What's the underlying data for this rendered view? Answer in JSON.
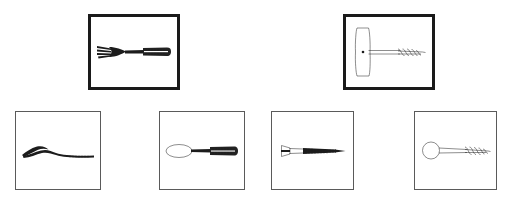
{
  "panel": {
    "title": "Visual analogy item",
    "background_color": "#ffffff",
    "prompt_border_color": "#1a1a1a",
    "option_border_color": "#5a5a5a",
    "ink_color": "#1c1c1c"
  },
  "prompt_row": {
    "row_label": "Top row",
    "boxes": [
      {
        "position": 1,
        "item_name": "fork",
        "icon": "fork-icon",
        "description": "Four-tined table fork with textured handle, pointing left",
        "border_style": "thick",
        "x": 88,
        "y": 14,
        "width": 92,
        "height": 76
      },
      {
        "position": 2,
        "item_name": "t-handle-screw",
        "icon": "t-handle-screw-icon",
        "description": "T-handled corkscrew style screw with vertical wooden handle and threaded shaft pointing right",
        "border_style": "thick",
        "x": 343,
        "y": 14,
        "width": 92,
        "height": 76
      }
    ]
  },
  "option_row": {
    "row_label": "Bottom row",
    "boxes": [
      {
        "position": 1,
        "item_name": "curved-tool",
        "icon": "curved-blade-icon",
        "description": "Long curved blade or shoehorn shaped tool with hooked tip at left",
        "border_style": "thin",
        "x": 15,
        "y": 111,
        "width": 86,
        "height": 79
      },
      {
        "position": 2,
        "item_name": "spoon",
        "icon": "spoon-icon",
        "description": "Table spoon with oval bowl at left and textured handle at right",
        "border_style": "thin",
        "x": 159,
        "y": 111,
        "width": 86,
        "height": 79
      },
      {
        "position": 3,
        "item_name": "flat-head-screw",
        "icon": "flat-head-screw-icon",
        "description": "Flat countersunk head wood screw with slotted head at left and threaded tapered shank",
        "border_style": "thin",
        "x": 271,
        "y": 111,
        "width": 83,
        "height": 79
      },
      {
        "position": 4,
        "item_name": "round-head-screw",
        "icon": "round-head-screw-icon",
        "description": "Screw with large round ring head at left and coarse threaded shank at right",
        "border_style": "thin",
        "x": 414,
        "y": 111,
        "width": 83,
        "height": 79
      }
    ]
  }
}
